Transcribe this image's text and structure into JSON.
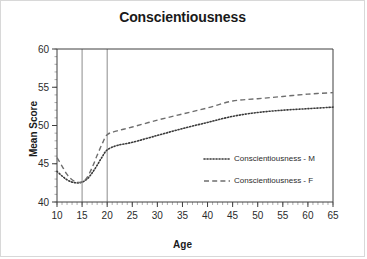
{
  "chart_data": {
    "type": "line",
    "title": "Conscientiousness",
    "xlabel": "Age",
    "ylabel": "Mean Score",
    "xlim": [
      10,
      65
    ],
    "ylim": [
      40,
      60
    ],
    "x_ticks": [
      10,
      15,
      20,
      25,
      30,
      35,
      40,
      45,
      50,
      55,
      60,
      65
    ],
    "y_ticks": [
      40,
      45,
      50,
      55,
      60
    ],
    "x_minor_step": 1,
    "y_minor_step": 1,
    "grid": false,
    "legend_position": "inside-right-lower",
    "reference_lines": [
      {
        "name": "ref-line-15",
        "axis": "x",
        "value": 15
      },
      {
        "name": "ref-line-20",
        "axis": "x",
        "value": 20
      }
    ],
    "x": [
      10,
      11,
      12,
      13,
      14,
      15,
      16,
      17,
      18,
      19,
      20,
      22,
      25,
      30,
      35,
      40,
      45,
      50,
      55,
      60,
      65
    ],
    "series": [
      {
        "name": "Conscientiousness - M",
        "style": "dotted",
        "color": "#3a3a3a",
        "values": [
          44.0,
          43.4,
          42.9,
          42.6,
          42.5,
          42.6,
          43.0,
          43.8,
          44.8,
          45.9,
          46.8,
          47.4,
          47.8,
          48.7,
          49.6,
          50.4,
          51.2,
          51.7,
          52.0,
          52.2,
          52.4
        ]
      },
      {
        "name": "Conscientiousness - F",
        "style": "dashed",
        "color": "#6e6e6e",
        "values": [
          45.8,
          44.7,
          43.6,
          42.9,
          42.6,
          42.6,
          43.2,
          44.5,
          46.1,
          47.6,
          48.8,
          49.3,
          49.8,
          50.7,
          51.5,
          52.3,
          53.2,
          53.5,
          53.8,
          54.1,
          54.3
        ]
      }
    ],
    "legend": [
      {
        "label": "Conscientiousness - M",
        "style": "dotted"
      },
      {
        "label": "Conscientiousness - F",
        "style": "dashed"
      }
    ]
  }
}
